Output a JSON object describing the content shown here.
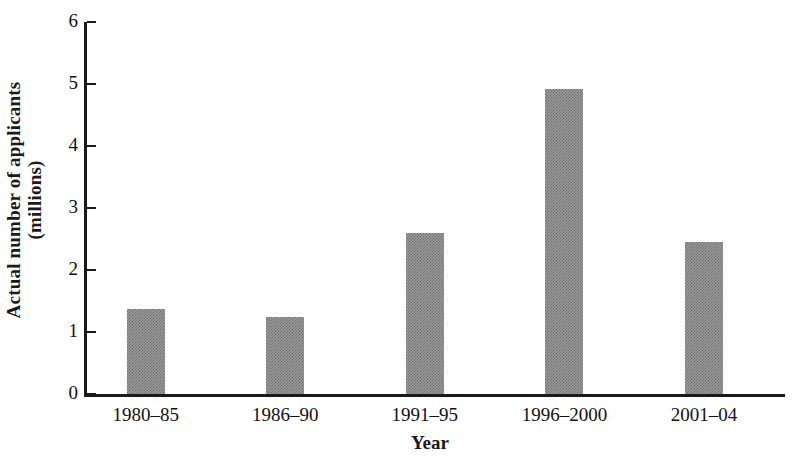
{
  "chart_data": {
    "type": "bar",
    "title": "",
    "xlabel": "Year",
    "ylabel_line1": "Actual number of applicants",
    "ylabel_line2": "(millions)",
    "ylabel": "Actual number of applicants (millions)",
    "categories": [
      "1980–85",
      "1986–90",
      "1991–95",
      "1996–2000",
      "2001–04"
    ],
    "values": [
      1.37,
      1.24,
      2.6,
      4.92,
      2.45
    ],
    "ylim": [
      0,
      6
    ],
    "yticks": [
      6,
      5,
      4,
      3,
      2,
      1,
      0
    ],
    "ytick_labels": [
      "6",
      "5",
      "4",
      "3",
      "2",
      "1",
      "0"
    ],
    "grid": false,
    "legend": "none",
    "bar_color": "#9a9a9a",
    "axis_color": "#1a1a1a",
    "background": "#ffffff"
  }
}
